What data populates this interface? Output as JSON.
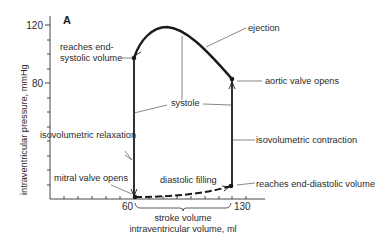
{
  "panel_label": "A",
  "axes": {
    "y_label": "intraventricular pressure, mmHg",
    "x_label": "intraventricular volume, ml",
    "y_ticks": [
      "120",
      "80"
    ],
    "x_ticks": [
      "60",
      "130"
    ]
  },
  "annotations": {
    "reaches_end_systolic_1": "reaches end-",
    "reaches_end_systolic_2": "systolic volume",
    "ejection": "ejection",
    "aortic_valve_opens": "aortic valve opens",
    "systole": "systole",
    "isovolumetric_relaxation": "isovolumetric relaxation",
    "isovolumetric_contraction": "isovolumetric contraction",
    "mitral_valve_opens": "mitral valve opens",
    "diastolic_filling": "diastolic filling",
    "reaches_end_diastolic": "reaches end-diastolic volume",
    "stroke_volume": "stroke volume"
  },
  "colors": {
    "ink": "#1a1a1a",
    "leader": "#555555",
    "background": "#ffffff"
  },
  "loop_points": {
    "end_systolic": {
      "volume_ml": 60,
      "pressure_mmHg": 100
    },
    "aortic_valve_opens": {
      "volume_ml": 130,
      "pressure_mmHg": 85
    },
    "end_diastolic": {
      "volume_ml": 130,
      "pressure_mmHg": 10
    },
    "mitral_valve_opens": {
      "volume_ml": 60,
      "pressure_mmHg": 2
    },
    "peak": {
      "volume_ml": 83,
      "pressure_mmHg": 119
    }
  }
}
